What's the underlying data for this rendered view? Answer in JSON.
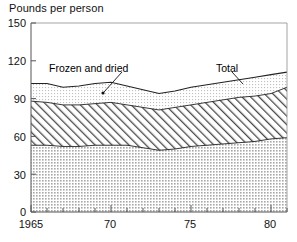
{
  "chart_data": {
    "type": "area",
    "title": "Pounds per person",
    "subtitle": "",
    "xlabel": "",
    "ylabel": "Pounds per person",
    "stacked": true,
    "grid": false,
    "legend_position": "inline-annotations",
    "xlim": [
      1965,
      1981
    ],
    "ylim": [
      0,
      150
    ],
    "yticks": [
      0,
      30,
      60,
      90,
      120,
      150
    ],
    "ytick_labels": [
      "0",
      "30",
      "60",
      "90",
      "120",
      "150"
    ],
    "xticks": [
      1965,
      1966,
      1967,
      1968,
      1969,
      1970,
      1971,
      1972,
      1973,
      1974,
      1975,
      1976,
      1977,
      1978,
      1979,
      1980,
      1981
    ],
    "xtick_labels": [
      "1965",
      "",
      "",
      "",
      "",
      "70",
      "",
      "",
      "",
      "",
      "75",
      "",
      "",
      "",
      "",
      "80",
      ""
    ],
    "x": [
      1965,
      1966,
      1967,
      1968,
      1969,
      1970,
      1971,
      1972,
      1973,
      1974,
      1975,
      1976,
      1977,
      1978,
      1979,
      1980,
      1981
    ],
    "series": [
      {
        "name": "Fresh",
        "label": "Fresh",
        "fill": "dots",
        "values": [
          53,
          53,
          52,
          52,
          53,
          53,
          53,
          51,
          49,
          50,
          52,
          53,
          54,
          55,
          56,
          58,
          59
        ]
      },
      {
        "name": "Canned",
        "label": "Canned",
        "fill": "diagonal-hatch",
        "values": [
          35,
          34,
          33,
          33,
          33,
          34,
          32,
          32,
          32,
          33,
          33,
          34,
          35,
          36,
          36,
          36,
          40
        ]
      },
      {
        "name": "Frozen and dried",
        "label": "Frozen and dried",
        "fill": "fine-dots",
        "values": [
          14,
          15,
          14,
          15,
          16,
          16,
          15,
          14,
          13,
          13,
          14,
          14,
          14,
          14,
          15,
          15,
          12
        ]
      }
    ],
    "totals": {
      "label": "Total",
      "values": [
        102,
        102,
        99,
        100,
        102,
        103,
        100,
        97,
        94,
        96,
        99,
        101,
        103,
        105,
        107,
        109,
        111
      ]
    },
    "annotations": [
      {
        "name": "frozen-and-dried-label",
        "text": "Frozen and dried",
        "has_leader_line": true
      },
      {
        "name": "total-label",
        "text": "Total",
        "has_leader_line": true
      },
      {
        "name": "canned-label",
        "text": "Canned",
        "has_leader_line": false
      },
      {
        "name": "fresh-label",
        "text": "Fresh",
        "has_leader_line": false
      }
    ],
    "colors": {
      "axis": "#555555",
      "line": "#222222",
      "text": "#111111",
      "fresh_fill": "#c9c9c9",
      "canned_fill": "#ffffff",
      "frozen_fill": "#e2e2e2",
      "background": "#ffffff"
    }
  }
}
